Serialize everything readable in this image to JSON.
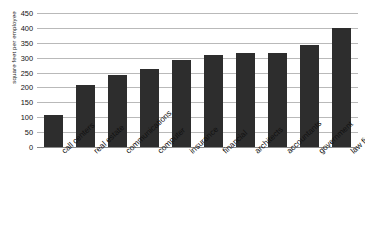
{
  "chart_data": {
    "type": "bar",
    "title": "",
    "subtitle": "",
    "xlabel": "",
    "ylabel": "square feet per employee",
    "ylim": [
      0,
      450
    ],
    "ytick_step": 50,
    "yticks": [
      450,
      400,
      350,
      300,
      250,
      200,
      150,
      100,
      50,
      0
    ],
    "grid": true,
    "legend": false,
    "legend_position": "none",
    "bar_color": "#2d2d2d",
    "grid_color": "#b9b9b9",
    "categories": [
      "call centers",
      "real estate",
      "communications",
      "computer",
      "insurance",
      "financial",
      "architects",
      "accountants",
      "government",
      "law firms"
    ],
    "values": [
      108,
      208,
      243,
      262,
      291,
      308,
      315,
      317,
      343,
      400
    ]
  }
}
